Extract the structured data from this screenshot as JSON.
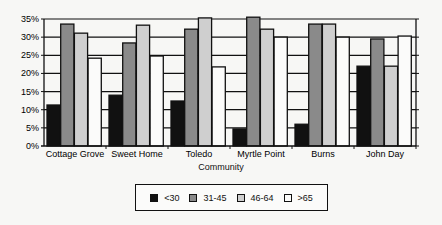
{
  "chart_data": {
    "type": "bar",
    "title": "",
    "xlabel": "Community",
    "ylabel": "",
    "ylim": [
      0,
      35
    ],
    "yticks": [
      "0%",
      "5%",
      "10%",
      "15%",
      "20%",
      "25%",
      "30%",
      "35%"
    ],
    "grid": true,
    "legend_position": "bottom",
    "categories": [
      "Cottage Grove",
      "Sweet Home",
      "Toledo",
      "Myrtle Point",
      "Burns",
      "John Day"
    ],
    "series": [
      {
        "name": "<30",
        "color": "#111111",
        "values": [
          11.3,
          14.0,
          12.4,
          4.7,
          6.0,
          22.0
        ]
      },
      {
        "name": "31-45",
        "color": "#8a8a8a",
        "values": [
          33.6,
          28.4,
          32.2,
          35.5,
          33.6,
          29.5
        ]
      },
      {
        "name": "46-64",
        "color": "#cfcfcf",
        "values": [
          31.1,
          33.3,
          35.3,
          32.2,
          33.6,
          22.0
        ]
      },
      {
        "name": ">65",
        "color": "#fbfbfa",
        "values": [
          24.2,
          24.8,
          21.8,
          30.0,
          30.0,
          30.3
        ]
      }
    ]
  }
}
